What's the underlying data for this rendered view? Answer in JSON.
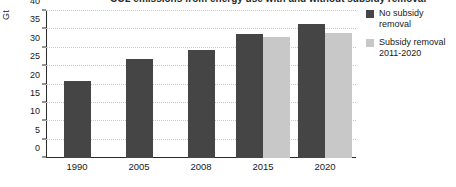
{
  "chart_data": {
    "type": "bar",
    "title": "",
    "xlabel": "",
    "ylabel": "Gt",
    "ylim": [
      0,
      40
    ],
    "yticks": [
      0,
      5,
      10,
      15,
      20,
      25,
      30,
      35,
      40
    ],
    "grid": true,
    "legend_position": "right",
    "categories": [
      "1990",
      "2005",
      "2008",
      "2015",
      "2020"
    ],
    "series": [
      {
        "name": "No subsidy removal",
        "color": "#454545",
        "values": [
          21,
          27,
          29.5,
          33.8,
          36.5
        ]
      },
      {
        "name": "Subsidy removal 2011-2020",
        "color": "#c8c8c8",
        "values": [
          null,
          null,
          null,
          33,
          34
        ]
      }
    ]
  },
  "axis": {
    "y_title": "Gt",
    "y_tick_labels": [
      "0",
      "5",
      "10",
      "15",
      "20",
      "25",
      "30",
      "35",
      "40"
    ],
    "x_tick_labels": [
      "1990",
      "2005",
      "2008",
      "2015",
      "2020"
    ]
  },
  "legend": {
    "items": [
      {
        "label": "No subsidy removal",
        "color": "#454545"
      },
      {
        "label": "Subsidy removal 2011-2020",
        "color": "#c8c8c8"
      }
    ]
  },
  "title_strip": {
    "text": "CO2 emissions from energy use with and without subsidy removal"
  }
}
